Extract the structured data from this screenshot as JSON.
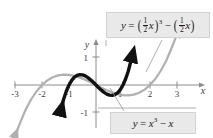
{
  "figure": {
    "background_color": "#ffffff",
    "width": 213,
    "height": 138
  },
  "axes": {
    "x_axis_label": "x",
    "y_axis_label": "y",
    "axis_color": "#8c8c8c",
    "x_ticks": [
      "-3",
      "-2",
      "-1",
      "1",
      "2",
      "3"
    ],
    "y_ticks": [
      "1",
      "-1"
    ],
    "origin_x_px": 96,
    "origin_y_px": 85,
    "unit_px": 27
  },
  "callouts": {
    "top": {
      "lhs": "y",
      "equals": "=",
      "frac1_num": "1",
      "frac1_den": "2",
      "var1": "x",
      "exponent": "3",
      "minus": "−",
      "frac2_num": "1",
      "frac2_den": "2",
      "var2": "x",
      "paren_open": "(",
      "paren_close": ")",
      "fill_color": "#e9e9e9"
    },
    "bottom": {
      "lhs": "y",
      "equals": "=",
      "var": "x",
      "exponent": "3",
      "minus": "−",
      "term": "x",
      "fill_color": "#e9e9e9"
    }
  },
  "chart_data": {
    "type": "line",
    "title": "",
    "xlabel": "x",
    "ylabel": "y",
    "xlim": [
      -3.6,
      3.6
    ],
    "ylim": [
      -1.75,
      1.6
    ],
    "grid": false,
    "legend": "callout-labels",
    "series": [
      {
        "name": "y = x^3 - x",
        "color": "#111111",
        "line_width": 3.4,
        "arrowheads": [
          "start",
          "end"
        ],
        "x": [
          -1.32,
          -1.2,
          -1.1,
          -1.0,
          -0.9,
          -0.8,
          -0.7,
          -0.6,
          -0.5,
          -0.4,
          -0.3,
          -0.2,
          -0.1,
          0.0,
          0.1,
          0.2,
          0.3,
          0.4,
          0.5,
          0.6,
          0.7,
          0.8,
          0.9,
          1.0,
          1.1,
          1.2,
          1.32
        ],
        "y": [
          -1.0,
          -0.528,
          -0.231,
          0.0,
          0.171,
          0.288,
          0.357,
          0.384,
          0.375,
          0.336,
          0.273,
          0.192,
          0.099,
          0.0,
          -0.099,
          -0.192,
          -0.273,
          -0.336,
          -0.375,
          -0.384,
          -0.357,
          -0.288,
          -0.171,
          0.0,
          0.231,
          0.528,
          1.0
        ]
      },
      {
        "name": "y = (1/2 x)^3 - (1/2 x)",
        "color": "#b0b0b0",
        "line_width": 2.2,
        "arrowheads": [
          "start",
          "end"
        ],
        "x": [
          -3.0,
          -2.8,
          -2.6,
          -2.4,
          -2.2,
          -2.0,
          -1.8,
          -1.6,
          -1.4,
          -1.2,
          -1.0,
          -0.8,
          -0.6,
          -0.4,
          -0.2,
          0.0,
          0.2,
          0.4,
          0.6,
          0.8,
          1.0,
          1.2,
          1.4,
          1.6,
          1.8,
          2.0,
          2.2,
          2.4,
          2.6,
          2.8,
          3.0
        ],
        "y": [
          -1.875,
          -1.372,
          -0.897,
          -0.528,
          -0.231,
          0.0,
          0.171,
          0.288,
          0.357,
          0.384,
          0.375,
          0.336,
          0.273,
          0.192,
          0.099,
          0.0,
          -0.099,
          -0.192,
          -0.273,
          -0.336,
          -0.375,
          -0.384,
          -0.357,
          -0.288,
          -0.171,
          0.0,
          0.231,
          0.528,
          0.897,
          1.372,
          1.875
        ]
      }
    ]
  }
}
